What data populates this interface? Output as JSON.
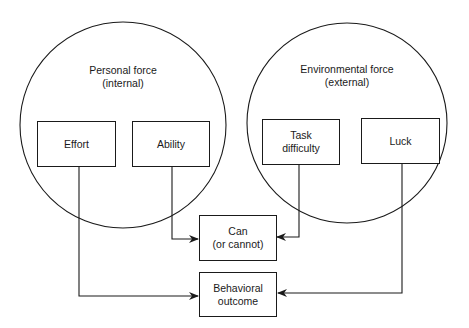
{
  "diagram": {
    "groups": [
      {
        "id": "personal",
        "title": "Personal force",
        "subtitle": "(internal)"
      },
      {
        "id": "environmental",
        "title": "Environmental force",
        "subtitle": "(external)"
      }
    ],
    "nodes": {
      "effort": "Effort",
      "ability": "Ability",
      "task": "Task\ndifficulty",
      "luck": "Luck",
      "can": "Can\n(or cannot)",
      "outcome": "Behavioral\noutcome"
    },
    "edges": [
      {
        "from": "Ability",
        "to": "Can (or cannot)"
      },
      {
        "from": "Task difficulty",
        "to": "Can (or cannot)"
      },
      {
        "from": "Effort",
        "to": "Behavioral outcome"
      },
      {
        "from": "Luck",
        "to": "Behavioral outcome"
      }
    ],
    "colors": {
      "stroke": "#1a1a1a",
      "background": "#ffffff"
    }
  }
}
